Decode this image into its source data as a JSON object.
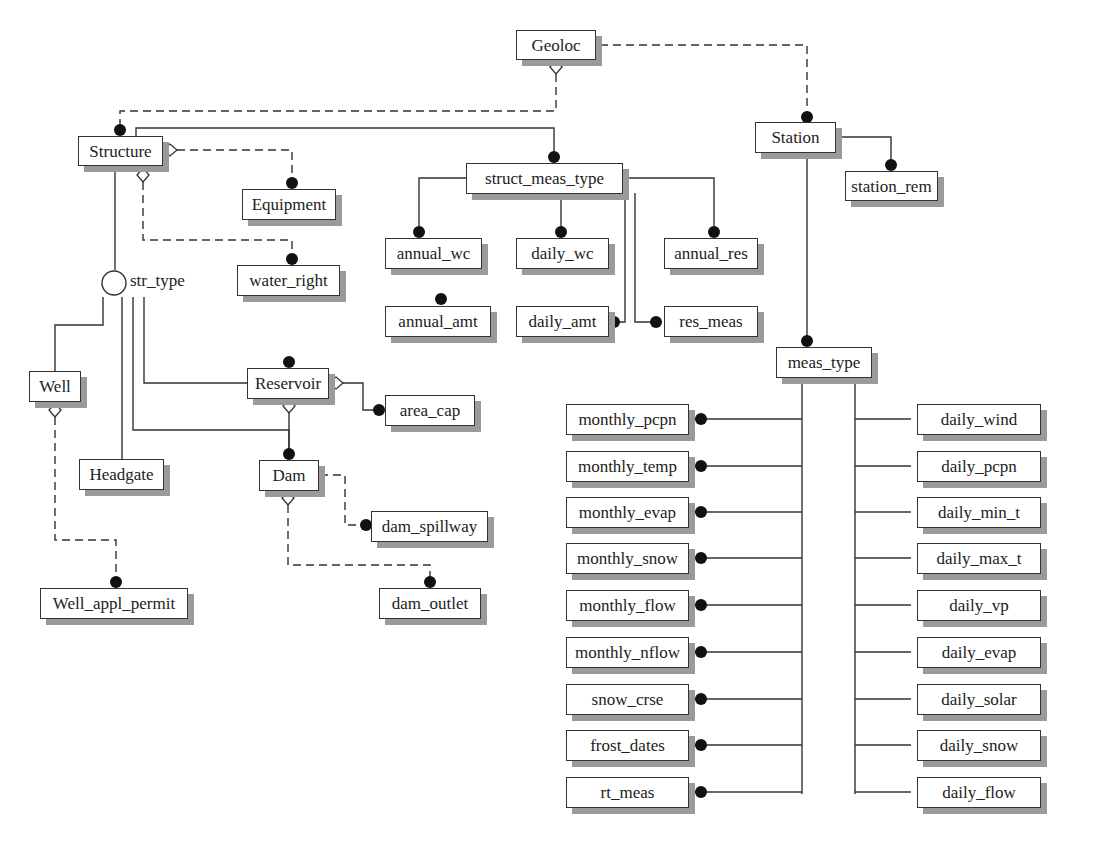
{
  "diagram": {
    "type": "entity-relationship",
    "entities": {
      "geoloc": "Geoloc",
      "station": "Station",
      "station_rem": "station_rem",
      "structure": "Structure",
      "equipment": "Equipment",
      "water_right": "water_right",
      "struct_meas_type": "struct_meas_type",
      "annual_wc": "annual_wc",
      "daily_wc": "daily_wc",
      "annual_res": "annual_res",
      "annual_amt": "annual_amt",
      "daily_amt": "daily_amt",
      "res_meas": "res_meas",
      "well": "Well",
      "reservoir": "Reservoir",
      "area_cap": "area_cap",
      "headgate": "Headgate",
      "dam": "Dam",
      "dam_spillway": "dam_spillway",
      "well_appl_permit": "Well_appl_permit",
      "dam_outlet": "dam_outlet",
      "meas_type": "meas_type"
    },
    "subtype_discriminator": "str_type",
    "monthly_entities": [
      "monthly_pcpn",
      "monthly_temp",
      "monthly_evap",
      "monthly_snow",
      "monthly_flow",
      "monthly_nflow",
      "snow_crse",
      "frost_dates",
      "rt_meas"
    ],
    "daily_entities": [
      "daily_wind",
      "daily_pcpn",
      "daily_min_t",
      "daily_max_t",
      "daily_vp",
      "daily_evap",
      "daily_solar",
      "daily_snow",
      "daily_flow"
    ],
    "colors": {
      "line": "#333333",
      "shadow": "#9a9a9a",
      "background": "#ffffff"
    }
  }
}
